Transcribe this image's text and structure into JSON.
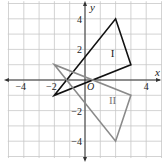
{
  "diagram": {
    "type": "coordinate-plane",
    "origin_px": [
      85,
      80
    ],
    "unit_px": 15.3,
    "grid": {
      "x_min": -5,
      "x_max": 5,
      "y_min": -5,
      "y_max": 5,
      "color": "#c8c8c8"
    },
    "axes": {
      "x_label": "x",
      "y_label": "y",
      "origin_label": "O",
      "color": "#333333",
      "x_ticks": [
        {
          "value": -4,
          "label": "−4"
        },
        {
          "value": -2,
          "label": "−2"
        },
        {
          "value": 4,
          "label": "4"
        }
      ],
      "y_ticks": [
        {
          "value": 4,
          "label": "4"
        },
        {
          "value": 2,
          "label": "2"
        },
        {
          "value": -2,
          "label": "−2"
        },
        {
          "value": -4,
          "label": "−4"
        }
      ]
    },
    "shapes": [
      {
        "name": "triangle-I",
        "label": "I",
        "vertices": [
          [
            -2,
            -1
          ],
          [
            2,
            4
          ],
          [
            3,
            1
          ]
        ],
        "label_pos": [
          1.8,
          1.5
        ],
        "color": "#111111"
      },
      {
        "name": "triangle-II",
        "label": "II",
        "vertices": [
          [
            -2,
            1
          ],
          [
            2,
            -4
          ],
          [
            3,
            -1
          ]
        ],
        "label_pos": [
          1.8,
          -1.6
        ],
        "color": "#8a8a8a"
      }
    ]
  }
}
